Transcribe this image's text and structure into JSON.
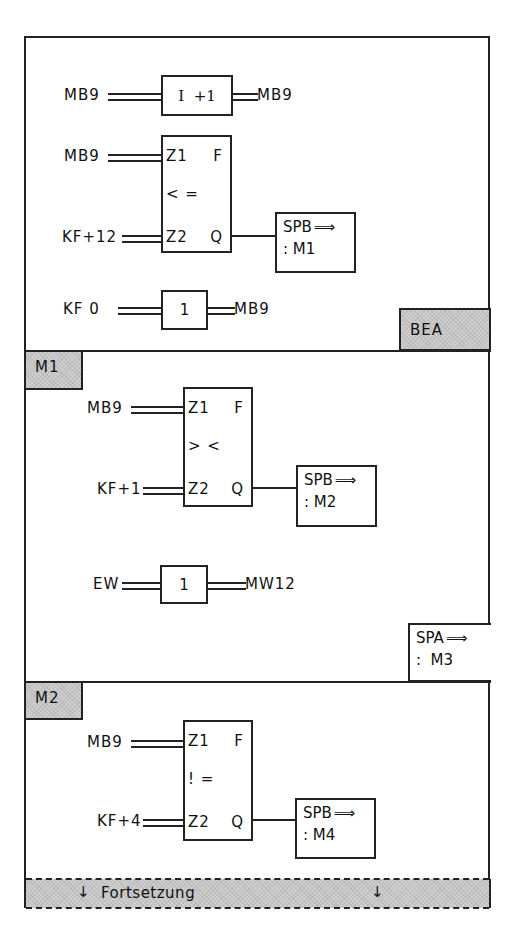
{
  "diagram": {
    "type": "function-block-diagram",
    "segments": [
      {
        "label": null,
        "increment": {
          "input": "MB9",
          "op": "I  +1",
          "output": "MB9"
        },
        "compare": {
          "in1": "MB9",
          "in2": "KF+12",
          "pin1": "Z1",
          "pin2": "Z2",
          "out_f": "F",
          "out_q": "Q",
          "op": "< ="
        },
        "jump": {
          "instr": "SPB",
          "arrow": "⟹",
          "target": ": M1"
        },
        "assign": {
          "input": "KF 0",
          "op": "1",
          "output": "MB9"
        },
        "end_tag": "BEA"
      },
      {
        "label": "M1",
        "compare": {
          "in1": "MB9",
          "in2": "KF+1",
          "pin1": "Z1",
          "pin2": "Z2",
          "out_f": "F",
          "out_q": "Q",
          "op": "> <"
        },
        "jump": {
          "instr": "SPB",
          "arrow": "⟹",
          "target": ": M2"
        },
        "assign": {
          "input": "EW",
          "op": "1",
          "output": "MW12"
        },
        "end_jump": {
          "instr": "SPA",
          "arrow": "⟹",
          "target": ":  M3"
        }
      },
      {
        "label": "M2",
        "compare": {
          "in1": "MB9",
          "in2": "KF+4",
          "pin1": "Z1",
          "pin2": "Z2",
          "out_f": "F",
          "out_q": "Q",
          "op": "! ="
        },
        "jump": {
          "instr": "SPB",
          "arrow": "⟹",
          "target": ": M4"
        }
      }
    ],
    "continuation": {
      "label": "Fortsetzung",
      "arrow_left": "↓",
      "arrow_right": "↓"
    }
  }
}
